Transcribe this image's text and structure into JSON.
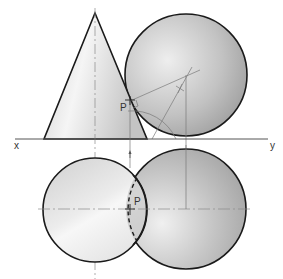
{
  "diagram": {
    "type": "orthographic-projection",
    "labels": {
      "x": "x",
      "y": "y",
      "p_elevation": "P",
      "p_plan": "P"
    },
    "colors": {
      "outline": "#1a1a1a",
      "construction": "#7a7a7a",
      "centerline": "#8a8a8a",
      "cone_fill_light": "#f4f4f4",
      "cone_fill_dark": "#c8c8c8",
      "sphere_fill_light": "#ececec",
      "sphere_fill_dark": "#a0a0a0"
    },
    "elevation": {
      "cone": {
        "apex": [
          95,
          13
        ],
        "base_left": [
          44,
          139
        ],
        "base_right": [
          147,
          139
        ]
      },
      "sphere": {
        "center": [
          186,
          75
        ],
        "radius": 61
      },
      "point_p": [
        130,
        101
      ]
    },
    "plan": {
      "cone_base_circle": {
        "center": [
          95,
          210
        ],
        "radius": 52
      },
      "sphere_circle": {
        "center": [
          186,
          209
        ],
        "radius": 60
      },
      "point_p": [
        130,
        209
      ]
    },
    "xy_line": {
      "y": 139,
      "x_start": 15,
      "x_end": 268
    }
  }
}
